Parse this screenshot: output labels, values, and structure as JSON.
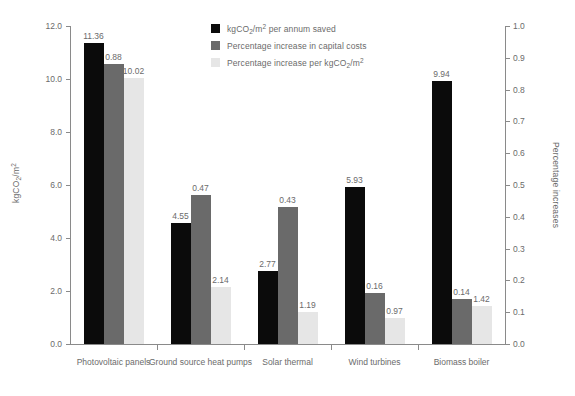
{
  "chart_data": {
    "type": "bar",
    "title": "",
    "xlabel": "",
    "ylabel": "kgCO2/m2",
    "ylabel_right": "Percentage increases",
    "ylim": [
      0,
      12
    ],
    "ylim_right": [
      0,
      1.0
    ],
    "grid": false,
    "legend_position": "top-center",
    "categories": [
      "Photovoltaic panels",
      "Ground source heat pumps",
      "Solar thermal",
      "Wind turbines",
      "Biomass boiler"
    ],
    "series": [
      {
        "name": "kgCO2/m2 per annum saved",
        "axis": "left",
        "color": "#0b0b0b",
        "values": [
          11.36,
          4.55,
          2.77,
          5.93,
          9.94
        ]
      },
      {
        "name": "Percentage increase in capital costs",
        "axis": "right",
        "color": "#6a6a6a",
        "values": [
          0.88,
          0.47,
          0.43,
          0.16,
          0.14
        ]
      },
      {
        "name": "Percentage increase per kgCO2/m2",
        "axis": "left",
        "color": "#e6e6e6",
        "values": [
          10.02,
          2.14,
          1.19,
          0.97,
          1.42
        ]
      }
    ],
    "yticks_left": [
      "0.0",
      "2.0",
      "4.0",
      "6.0",
      "8.0",
      "10.0",
      "12.0"
    ],
    "yticks_right": [
      "0.0",
      "0.1",
      "0.2",
      "0.3",
      "0.4",
      "0.5",
      "0.6",
      "0.7",
      "0.8",
      "0.9",
      "1.0"
    ]
  },
  "axes": {
    "left_title_main": "kgCO",
    "left_title_sub": "2",
    "left_title_rest": "/m",
    "left_title_sup": "2",
    "right_title": "Percentage increases"
  },
  "legend": {
    "items": [
      {
        "prefix": "kgCO",
        "sub": "2",
        "mid": "/m",
        "sup": "2",
        "suffix": " per annum saved"
      },
      {
        "prefix": "Percentage increase in capital costs",
        "sub": "",
        "mid": "",
        "sup": "",
        "suffix": ""
      },
      {
        "prefix": "Percentage increase per kgCO",
        "sub": "2",
        "mid": "/m",
        "sup": "2",
        "suffix": ""
      }
    ]
  }
}
